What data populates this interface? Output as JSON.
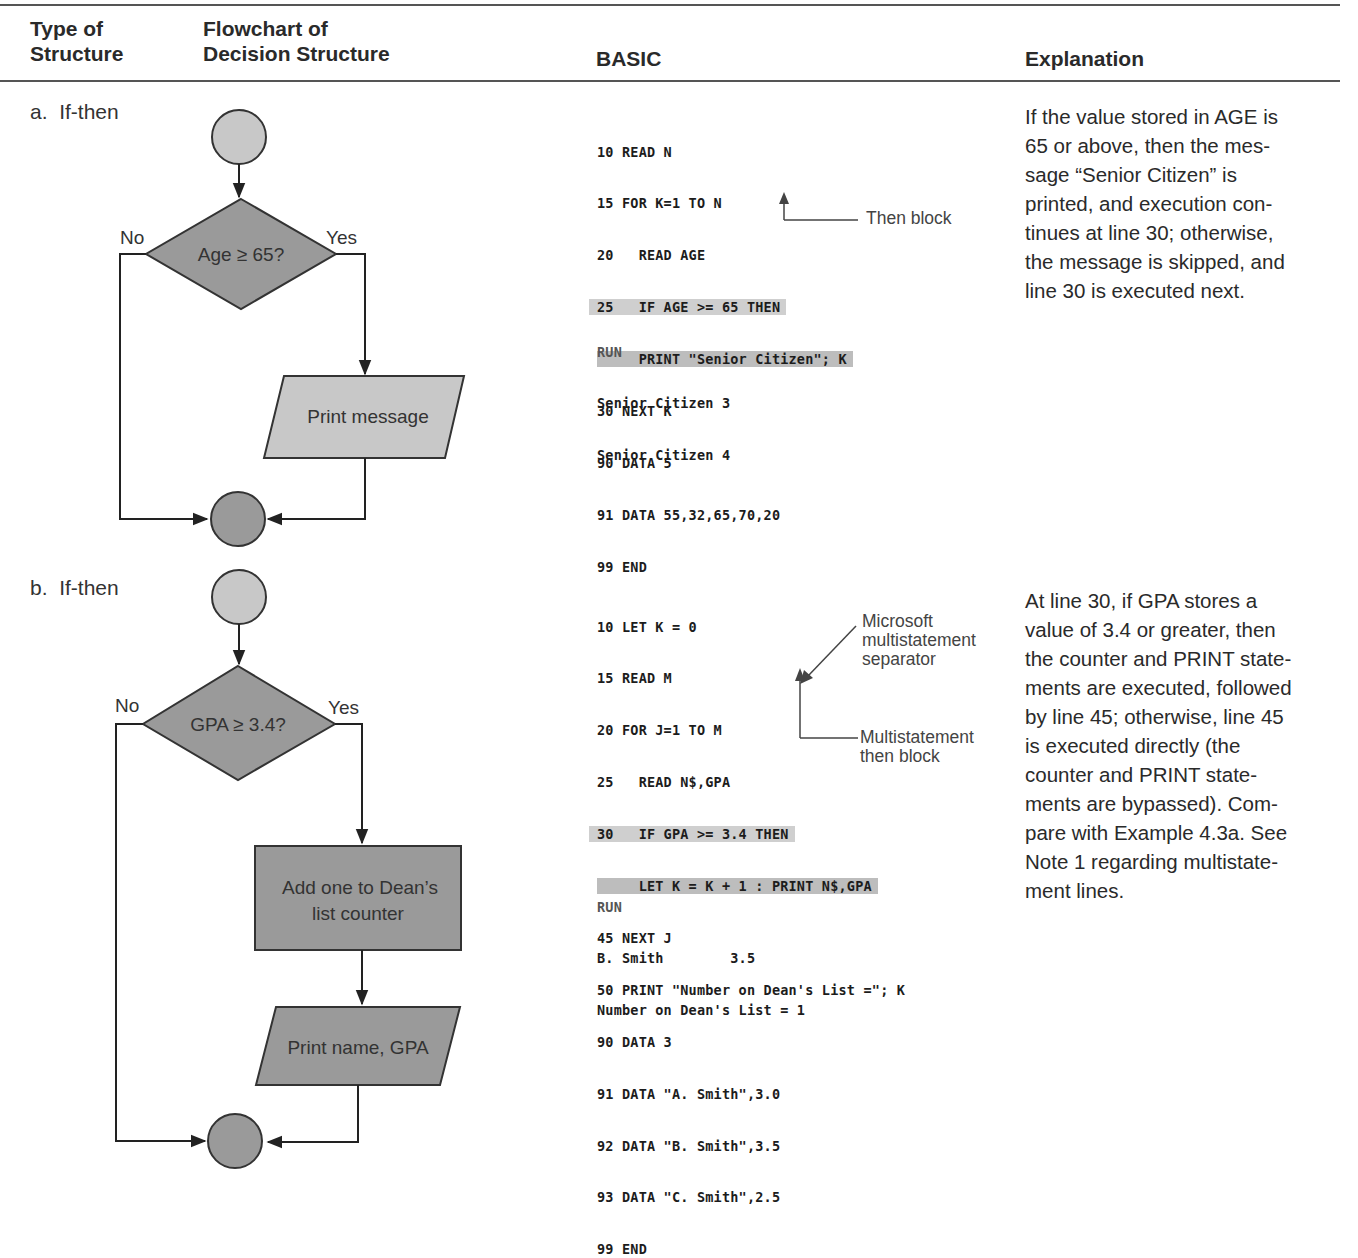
{
  "table": {
    "headers": {
      "type": [
        "Type of",
        "Structure"
      ],
      "flowchart": [
        "Flowchart of",
        "Decision Structure"
      ],
      "basic": "BASIC",
      "explanation": "Explanation"
    },
    "rows": [
      {
        "label": "a.  If-then",
        "flowchart": {
          "decision": "Age ≥ 65?",
          "no_label": "No",
          "yes_label": "Yes",
          "process": "Print message"
        },
        "code": [
          {
            "text": "10 READ N",
            "highlight": false
          },
          {
            "text": "15 FOR K=1 TO N",
            "highlight": false
          },
          {
            "text": "20   READ AGE",
            "highlight": false
          },
          {
            "text": "25   IF AGE >= 65 THEN",
            "highlight": true
          },
          {
            "text": "     PRINT \"Senior Citizen\"; K",
            "highlight": true
          },
          {
            "text": "30 NEXT K",
            "highlight": false
          },
          {
            "text": "90 DATA 5",
            "highlight": false
          },
          {
            "text": "91 DATA 55,32,65,70,20",
            "highlight": false
          },
          {
            "text": "99 END",
            "highlight": false
          }
        ],
        "annotations": {
          "then_block": "Then block"
        },
        "run": {
          "label": "RUN",
          "output": [
            "Senior Citizen 3",
            "Senior Citizen 4"
          ]
        },
        "explanation": [
          "If the value stored in AGE is",
          "65 or above, then the mes-",
          "sage “Senior Citizen” is",
          "printed, and execution con-",
          "tinues at line 30; otherwise,",
          "the message is skipped, and",
          "line 30 is executed next."
        ]
      },
      {
        "label": "b.  If-then",
        "flowchart": {
          "decision": "GPA ≥ 3.4?",
          "no_label": "No",
          "yes_label": "Yes",
          "process": [
            "Add one to Dean’s",
            "list counter"
          ],
          "output": "Print name, GPA"
        },
        "code": [
          {
            "text": "10 LET K = 0",
            "highlight": false
          },
          {
            "text": "15 READ M",
            "highlight": false
          },
          {
            "text": "20 FOR J=1 TO M",
            "highlight": false
          },
          {
            "text": "25   READ N$,GPA",
            "highlight": false
          },
          {
            "text": "30   IF GPA >= 3.4 THEN",
            "highlight": true
          },
          {
            "text": "     LET K = K + 1 : PRINT N$,GPA",
            "highlight": true
          },
          {
            "text": "45 NEXT J",
            "highlight": false
          },
          {
            "text": "50 PRINT \"Number on Dean's List =\"; K",
            "highlight": false
          },
          {
            "text": "90 DATA 3",
            "highlight": false
          },
          {
            "text": "91 DATA \"A. Smith\",3.0",
            "highlight": false
          },
          {
            "text": "92 DATA \"B. Smith\",3.5",
            "highlight": false
          },
          {
            "text": "93 DATA \"C. Smith\",2.5",
            "highlight": false
          },
          {
            "text": "99 END",
            "highlight": false
          }
        ],
        "annotations": {
          "separator": [
            "Microsoft",
            "multistatement",
            "separator"
          ],
          "then_block": [
            "Multistatement",
            "then block"
          ]
        },
        "run": {
          "label": "RUN",
          "output": [
            "B. Smith        3.5",
            "Number on Dean's List = 1"
          ]
        },
        "explanation": [
          "At line 30, if GPA stores a",
          "value of 3.4 or greater, then",
          "the counter and PRINT state-",
          "ments are executed, followed",
          "by line 45; otherwise, line 45",
          "is executed directly (the",
          "counter and PRINT state-",
          "ments are bypassed). Com-",
          "pare with Example 4.3a. See",
          "Note 1 regarding multistate-",
          "ment lines."
        ]
      }
    ]
  },
  "colors": {
    "shape_fill_light": "#c8c8c8",
    "shape_fill_dark": "#9a9a9a",
    "highlight": "#cfcfcf",
    "rule": "#555555"
  }
}
